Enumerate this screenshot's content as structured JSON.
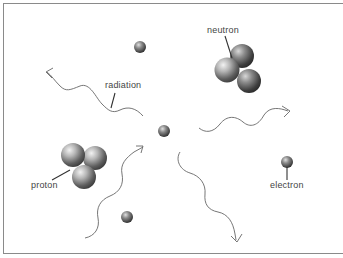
{
  "diagram": {
    "type": "particle-radiation-illustration",
    "labels": {
      "neutron": "neutron",
      "radiation": "radiation",
      "proton": "proton",
      "electron": "electron"
    },
    "particles": [
      {
        "kind": "nucleon-cluster",
        "label": "neutron",
        "count": 3
      },
      {
        "kind": "nucleon-cluster",
        "label": "proton",
        "count": 3
      },
      {
        "kind": "small-sphere",
        "label": "electron"
      },
      {
        "kind": "small-sphere",
        "label": ""
      },
      {
        "kind": "small-sphere",
        "label": ""
      },
      {
        "kind": "small-sphere",
        "label": ""
      }
    ],
    "radiation_waves": 4,
    "colors": {
      "frame": "#8a8a8a",
      "line": "#555555",
      "text": "#444444",
      "sphere_light": "#e8e8e8",
      "sphere_dark": "#3a3a3a"
    }
  }
}
